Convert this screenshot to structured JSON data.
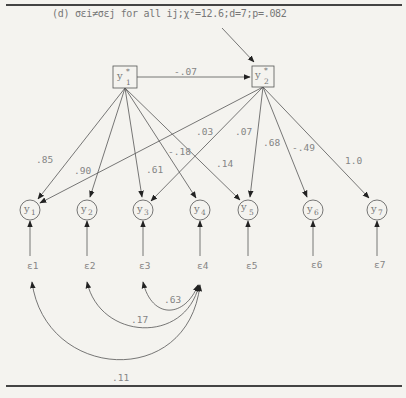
{
  "caption": "(d) σεi≠σεj for all ij;χ²=12.6;d=7;p=.082",
  "latent": [
    {
      "id": "y1*",
      "base": "y",
      "sup": "*",
      "sub": "1"
    },
    {
      "id": "y2*",
      "base": "y",
      "sup": "*",
      "sub": "2"
    }
  ],
  "latent_path_label": "-.07",
  "observed": [
    {
      "base": "y",
      "sub": "1"
    },
    {
      "base": "y",
      "sub": "2"
    },
    {
      "base": "y",
      "sub": "3"
    },
    {
      "base": "y",
      "sub": "4"
    },
    {
      "base": "y",
      "sub": "5"
    },
    {
      "base": "y",
      "sub": "6"
    },
    {
      "base": "y",
      "sub": "7"
    }
  ],
  "errors": [
    "ε1",
    "ε2",
    "ε3",
    "ε4",
    "ε5",
    "ε6",
    "ε7"
  ],
  "loadings": {
    "y1_to_y1": ".85",
    "y1_to_y2": ".90",
    "y1_to_y3": ".61",
    "y1_to_y4": "-.18",
    "y1_to_y5": ".14",
    "y2_to_y1": ".03",
    "y2_to_y3": ".07",
    "y2_to_y5": ".68",
    "y2_to_y6": "-.49",
    "y2_to_y7": "1.0"
  },
  "covariances": {
    "e3_e4": ".63",
    "e2_e4": ".17",
    "e1_e4": ".11"
  },
  "colors": {
    "line": "#555555",
    "text": "#858585",
    "background": "#f4f3ef"
  }
}
